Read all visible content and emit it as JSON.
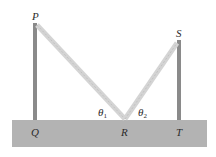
{
  "diagram": {
    "labels": {
      "P": "P",
      "S": "S",
      "Q": "Q",
      "R": "R",
      "T": "T",
      "theta1": "θ",
      "theta1_sub": "1",
      "theta2": "θ",
      "theta2_sub": "2"
    },
    "colors": {
      "ground": "#b3b3b3",
      "pole": "#8a8a8a",
      "rope": "#d4d4d4",
      "text": "#2b2b2b"
    }
  }
}
